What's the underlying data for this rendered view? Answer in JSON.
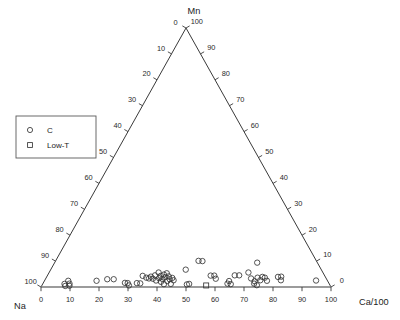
{
  "chart_data": {
    "type": "scatter",
    "plot_kind": "ternary",
    "title": "",
    "vertices": {
      "top": "Mn",
      "bottom_left": "Na",
      "bottom_right": "Ca/100"
    },
    "axes": {
      "left": {
        "name": "Na",
        "from_apex_value": 0,
        "to_corner_value": 100,
        "ticks": [
          0,
          10,
          20,
          30,
          40,
          50,
          60,
          70,
          80,
          90,
          100
        ],
        "tick_labels": [
          "0",
          "10",
          "20",
          "30",
          "40",
          "50",
          "60",
          "70",
          "80",
          "90",
          "100"
        ]
      },
      "right": {
        "name": "Mn",
        "from_apex_value": 100,
        "to_corner_value": 0,
        "ticks": [
          100,
          90,
          80,
          70,
          60,
          50,
          40,
          30,
          20,
          10,
          0
        ],
        "tick_labels": [
          "100",
          "90",
          "80",
          "70",
          "60",
          "50",
          "40",
          "30",
          "20",
          "10",
          "0"
        ]
      },
      "bottom": {
        "name": "Ca/100",
        "from_left_value": 0,
        "to_right_value": 100,
        "ticks": [
          0,
          10,
          20,
          30,
          40,
          50,
          60,
          70,
          80,
          90,
          100
        ],
        "tick_labels": [
          "0",
          "10",
          "20",
          "30",
          "40",
          "50",
          "60",
          "70",
          "80",
          "90",
          "100"
        ]
      }
    },
    "grid": false,
    "legend_position": "upper-left",
    "legend": [
      {
        "marker": "circle",
        "label": "C"
      },
      {
        "marker": "square",
        "label": "Low-T"
      }
    ],
    "series": [
      {
        "name": "C",
        "marker": "circle",
        "points": [
          {
            "x": 7.6,
            "y": 1.2
          },
          {
            "x": 8.4,
            "y": 2.4
          },
          {
            "x": 9.3,
            "y": 1.3
          },
          {
            "x": 8.2,
            "y": 0.4
          },
          {
            "x": 9.6,
            "y": 0.5
          },
          {
            "x": 18.4,
            "y": 2.4
          },
          {
            "x": 22.0,
            "y": 3.0
          },
          {
            "x": 24.3,
            "y": 3.0
          },
          {
            "x": 28.6,
            "y": 1.6
          },
          {
            "x": 29.6,
            "y": 1.5
          },
          {
            "x": 30.2,
            "y": 0.6
          },
          {
            "x": 32.8,
            "y": 1.5
          },
          {
            "x": 34.0,
            "y": 1.4
          },
          {
            "x": 34.4,
            "y": 4.3
          },
          {
            "x": 35.8,
            "y": 3.6
          },
          {
            "x": 36.8,
            "y": 3.3
          },
          {
            "x": 37.4,
            "y": 4.0
          },
          {
            "x": 38.2,
            "y": 3.2
          },
          {
            "x": 38.8,
            "y": 4.5
          },
          {
            "x": 39.4,
            "y": 2.5
          },
          {
            "x": 40.0,
            "y": 5.6
          },
          {
            "x": 40.4,
            "y": 3.4
          },
          {
            "x": 40.9,
            "y": 4.3
          },
          {
            "x": 41.2,
            "y": 2.0
          },
          {
            "x": 41.6,
            "y": 3.1
          },
          {
            "x": 42.0,
            "y": 4.8
          },
          {
            "x": 42.3,
            "y": 1.1
          },
          {
            "x": 42.6,
            "y": 3.8
          },
          {
            "x": 43.0,
            "y": 5.3
          },
          {
            "x": 43.4,
            "y": 2.3
          },
          {
            "x": 43.8,
            "y": 4.1
          },
          {
            "x": 44.2,
            "y": 3.0
          },
          {
            "x": 44.7,
            "y": 1.2
          },
          {
            "x": 45.1,
            "y": 3.5
          },
          {
            "x": 45.6,
            "y": 2.6
          },
          {
            "x": 49.9,
            "y": 6.7
          },
          {
            "x": 50.3,
            "y": 1.0
          },
          {
            "x": 51.1,
            "y": 1.2
          },
          {
            "x": 54.8,
            "y": 10.1
          },
          {
            "x": 56.3,
            "y": 10.0
          },
          {
            "x": 58.9,
            "y": 4.4
          },
          {
            "x": 60.2,
            "y": 4.4
          },
          {
            "x": 60.6,
            "y": 3.2
          },
          {
            "x": 64.5,
            "y": 1.3
          },
          {
            "x": 65.2,
            "y": 2.3
          },
          {
            "x": 65.6,
            "y": 1.1
          },
          {
            "x": 67.6,
            "y": 4.5
          },
          {
            "x": 69.2,
            "y": 4.5
          },
          {
            "x": 72.8,
            "y": 5.6
          },
          {
            "x": 73.2,
            "y": 3.3
          },
          {
            "x": 73.8,
            "y": 1.3
          },
          {
            "x": 74.2,
            "y": 2.2
          },
          {
            "x": 74.6,
            "y": 0.7
          },
          {
            "x": 75.6,
            "y": 3.6
          },
          {
            "x": 76.3,
            "y": 2.6
          },
          {
            "x": 77.1,
            "y": 9.4
          },
          {
            "x": 77.4,
            "y": 3.9
          },
          {
            "x": 78.2,
            "y": 3.6
          },
          {
            "x": 78.6,
            "y": 2.4
          },
          {
            "x": 83.0,
            "y": 3.9
          },
          {
            "x": 84.2,
            "y": 4.0
          },
          {
            "x": 83.6,
            "y": 2.6
          },
          {
            "x": 96.0,
            "y": 2.5
          }
        ]
      },
      {
        "name": "Low-T",
        "marker": "square",
        "points": [
          {
            "x": 57.0,
            "y": 0.6
          }
        ]
      }
    ]
  },
  "legend": {
    "item_c": "C",
    "item_lowt": "Low-T"
  },
  "labels": {
    "apex": "Mn",
    "left_corner": "Na",
    "right_corner": "Ca/100"
  },
  "colors": {
    "axis": "#3a3a3a",
    "baseline": "#7a7a7a",
    "marker": "#353535",
    "text": "#1c1c1c",
    "background": "#ffffff"
  }
}
